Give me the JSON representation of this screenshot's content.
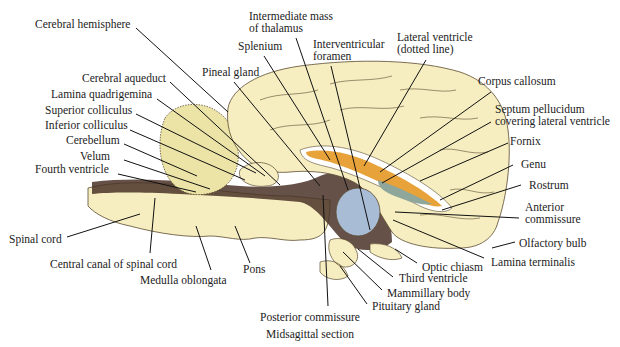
{
  "diagram": {
    "caption": "Midsagittal section",
    "colors": {
      "tissue": "#f6eec0",
      "tissue_outline": "#5a4a30",
      "dark_matter": "#4a3328",
      "thalamus_mass": "#a9bcd6",
      "ventricle_orange": "#e8a23a",
      "ventricle_teal": "#8fa79a",
      "leader_line": "#111111"
    },
    "labels": [
      {
        "id": "cerebral-hemisphere",
        "text": "Cerebral hemisphere",
        "x": 35,
        "y": 18,
        "anchor": "left",
        "line": [
          136,
          28,
          228,
          112
        ]
      },
      {
        "id": "intermediate-mass",
        "text": "Intermediate mass",
        "text2": "of thalamus",
        "x": 249,
        "y": 10,
        "anchor": "left",
        "line": [
          296,
          38,
          348,
          190
        ]
      },
      {
        "id": "splenium",
        "text": "Splenium",
        "x": 238,
        "y": 40,
        "anchor": "left",
        "line": [
          264,
          56,
          330,
          160
        ]
      },
      {
        "id": "interventricular-foramen",
        "text": "Interventricular",
        "text2": "foramen",
        "x": 313,
        "y": 38,
        "anchor": "left",
        "line": [
          331,
          66,
          370,
          230
        ]
      },
      {
        "id": "lateral-ventricle",
        "text": "Lateral ventricle",
        "text2": "(dotted line)",
        "x": 397,
        "y": 31,
        "anchor": "left",
        "line": [
          426,
          60,
          364,
          166
        ]
      },
      {
        "id": "pineal-gland",
        "text": "Pineal gland",
        "x": 202,
        "y": 66,
        "anchor": "left",
        "line": [
          234,
          82,
          320,
          186
        ]
      },
      {
        "id": "cerebral-aqueduct",
        "text": "Cerebral aqueduct",
        "x": 82,
        "y": 72,
        "anchor": "left",
        "line": [
          170,
          82,
          280,
          185
        ]
      },
      {
        "id": "lamina-quadrigemina",
        "text": "Lamina quadrigemina",
        "x": 51,
        "y": 88,
        "anchor": "left",
        "line": [
          157,
          99,
          265,
          176
        ]
      },
      {
        "id": "superior-colliculus",
        "text": "Superior colliculus",
        "x": 45,
        "y": 104,
        "anchor": "left",
        "line": [
          136,
          114,
          256,
          173
        ]
      },
      {
        "id": "inferior-colliculus",
        "text": "Inferior colliculus",
        "x": 45,
        "y": 119,
        "anchor": "left",
        "line": [
          130,
          130,
          245,
          180
        ]
      },
      {
        "id": "cerebellum",
        "text": "Cerebellum",
        "x": 66,
        "y": 134,
        "anchor": "left",
        "line": [
          124,
          144,
          197,
          176
        ]
      },
      {
        "id": "velum",
        "text": "Velum",
        "x": 80,
        "y": 150,
        "anchor": "left",
        "line": [
          124,
          160,
          210,
          189
        ]
      },
      {
        "id": "fourth-ventricle",
        "text": "Fourth ventricle",
        "x": 35,
        "y": 163,
        "anchor": "left",
        "line": [
          118,
          174,
          196,
          192
        ]
      },
      {
        "id": "corpus-callosum",
        "text": "Corpus callosum",
        "x": 478,
        "y": 75,
        "anchor": "left",
        "line": [
          491,
          92,
          380,
          172
        ]
      },
      {
        "id": "septum-pellucidum",
        "text": "Septum pellucidum",
        "text2": "covering lateral ventricle",
        "x": 495,
        "y": 103,
        "anchor": "left",
        "line": [
          491,
          122,
          382,
          183
        ]
      },
      {
        "id": "fornix",
        "text": "Fornix",
        "x": 510,
        "y": 135,
        "anchor": "left",
        "line": [
          508,
          143,
          420,
          181
        ]
      },
      {
        "id": "genu",
        "text": "Genu",
        "x": 521,
        "y": 158,
        "anchor": "left",
        "line": [
          513,
          165,
          440,
          200
        ]
      },
      {
        "id": "rostrum",
        "text": "Rostrum",
        "x": 529,
        "y": 179,
        "anchor": "left",
        "line": [
          521,
          185,
          442,
          210
        ]
      },
      {
        "id": "anterior-commissure",
        "text": "Anterior",
        "text2": "commissure",
        "x": 525,
        "y": 201,
        "anchor": "left",
        "line": [
          519,
          218,
          395,
          212
        ]
      },
      {
        "id": "olfactory-bulb",
        "text": "Olfactory bulb",
        "x": 519,
        "y": 237,
        "anchor": "left",
        "line": [
          515,
          242,
          492,
          248
        ]
      },
      {
        "id": "lamina-terminalis",
        "text": "Lamina terminalis",
        "x": 491,
        "y": 256,
        "anchor": "left",
        "line": [
          484,
          258,
          393,
          220
        ]
      },
      {
        "id": "optic-chiasm",
        "text": "Optic chiasm",
        "x": 422,
        "y": 261,
        "anchor": "left",
        "line": [
          417,
          263,
          395,
          249
        ]
      },
      {
        "id": "third-ventricle",
        "text": "Third ventricle",
        "x": 399,
        "y": 272,
        "anchor": "left",
        "line": [
          393,
          277,
          358,
          249
        ]
      },
      {
        "id": "mammillary-body",
        "text": "Mammillary body",
        "x": 387,
        "y": 287,
        "anchor": "left",
        "line": [
          382,
          290,
          343,
          252
        ]
      },
      {
        "id": "pituitary-gland",
        "text": "Pituitary gland",
        "x": 372,
        "y": 300,
        "anchor": "left",
        "line": [
          367,
          304,
          340,
          266
        ]
      },
      {
        "id": "posterior-commissure",
        "text": "Posterior commissure",
        "x": 260,
        "y": 311,
        "anchor": "left",
        "line": [
          328,
          306,
          323,
          195
        ]
      },
      {
        "id": "spinal-cord",
        "text": "Spinal cord",
        "x": 9,
        "y": 233,
        "anchor": "left",
        "line": [
          67,
          237,
          140,
          214
        ]
      },
      {
        "id": "central-canal",
        "text": "Central canal of spinal cord",
        "x": 50,
        "y": 258,
        "anchor": "left",
        "line": [
          150,
          253,
          155,
          198
        ]
      },
      {
        "id": "medulla-oblongata",
        "text": "Medulla oblongata",
        "x": 140,
        "y": 274,
        "anchor": "left",
        "line": [
          211,
          270,
          196,
          226
        ]
      },
      {
        "id": "pons",
        "text": "Pons",
        "x": 243,
        "y": 263,
        "anchor": "left",
        "line": [
          250,
          263,
          235,
          226
        ]
      }
    ]
  }
}
